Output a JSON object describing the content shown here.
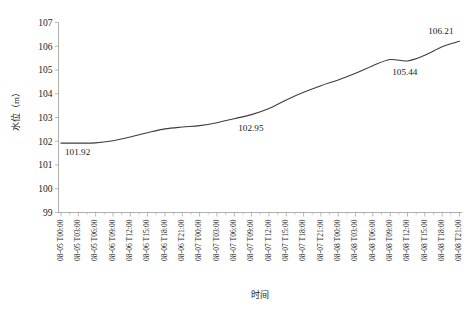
{
  "chart_data": {
    "type": "line",
    "title": "",
    "xlabel": "时间",
    "ylabel": "水位（m）",
    "ylim": [
      99,
      107
    ],
    "ytick_labels": [
      "107",
      "106",
      "105",
      "104",
      "103",
      "102",
      "101",
      "100",
      "99"
    ],
    "ytick_values": [
      107,
      106,
      105,
      104,
      103,
      102,
      101,
      100,
      99
    ],
    "grid": false,
    "legend": null,
    "categories": [
      "08-05 T00:00",
      "08-05 T03:00",
      "08-05 T06:00",
      "08-06 T09:00",
      "08-06 T12:00",
      "08-06 T15:00",
      "08-06 T18:00",
      "08-06 T21:00",
      "08-07 T00:00",
      "08-07 T03:00",
      "08-07 T06:00",
      "08-07 T09:00",
      "08-07 T12:00",
      "08-07 T15:00",
      "08-07 T18:00",
      "08-07 T21:00",
      "08-08 T00:00",
      "08-08 T03:00",
      "08-08 T06:00",
      "08-08 T09:00",
      "08-08 T12:00",
      "08-08 T15:00",
      "08-08 T18:00",
      "08-08 T21:00"
    ],
    "values": [
      101.92,
      101.92,
      101.93,
      102.02,
      102.18,
      102.36,
      102.52,
      102.6,
      102.66,
      102.78,
      102.95,
      103.12,
      103.38,
      103.74,
      104.06,
      104.34,
      104.58,
      104.86,
      105.18,
      105.44,
      105.38,
      105.62,
      105.98,
      106.21
    ],
    "annotations": [
      {
        "name": "start-value",
        "text": "101.92",
        "x_index": 0,
        "value": 101.92
      },
      {
        "name": "mid-value",
        "text": "102.95",
        "x_index": 10,
        "value": 102.95
      },
      {
        "name": "dip-value",
        "text": "105.44",
        "x_index": 19,
        "value": 105.44
      },
      {
        "name": "end-value",
        "text": "106.21",
        "x_index": 23,
        "value": 106.21
      }
    ],
    "colors": {
      "line": "#3d3d3d",
      "axis": "#9a9a9a",
      "text": "#1a1a1a",
      "background": "#ffffff"
    }
  }
}
